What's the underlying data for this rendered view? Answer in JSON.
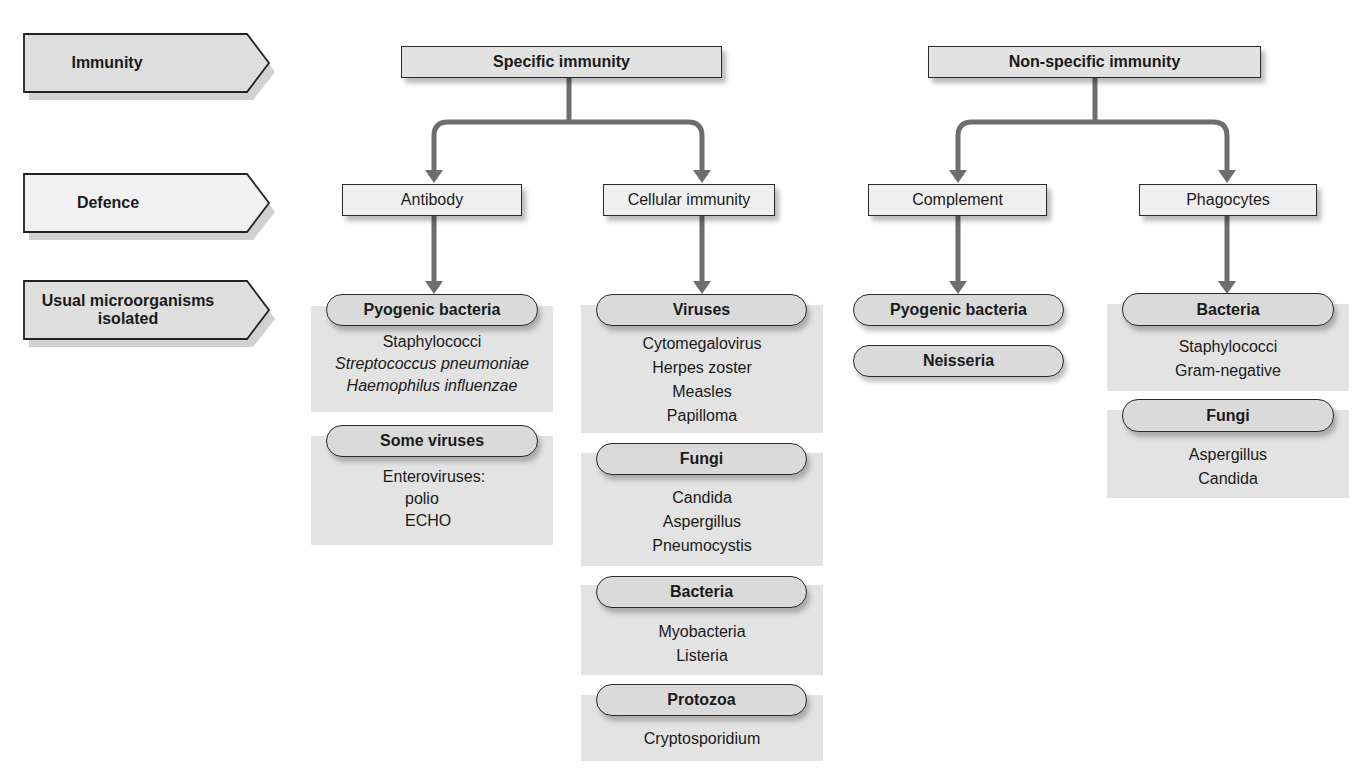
{
  "row_labels": {
    "immunity": "Immunity",
    "defence": "Defence",
    "microorganisms_line1": "Usual microorganisms",
    "microorganisms_line2": "isolated"
  },
  "immunity": {
    "specific": {
      "label": "Specific immunity",
      "defences": [
        {
          "label": "Antibody",
          "groups": [
            {
              "title": "Pyogenic bacteria",
              "items": [
                "Staphylococci",
                "Streptococcus pneumoniae",
                "Haemophilus influenzae"
              ]
            },
            {
              "title": "Some viruses",
              "items": [
                "Enteroviruses:",
                "polio",
                "ECHO"
              ]
            }
          ]
        },
        {
          "label": "Cellular immunity",
          "groups": [
            {
              "title": "Viruses",
              "items": [
                "Cytomegalovirus",
                "Herpes zoster",
                "Measles",
                "Papilloma"
              ]
            },
            {
              "title": "Fungi",
              "items": [
                "Candida",
                "Aspergillus",
                "Pneumocystis"
              ]
            },
            {
              "title": "Bacteria",
              "items": [
                "Myobacteria",
                "Listeria"
              ]
            },
            {
              "title": "Protozoa",
              "items": [
                "Cryptosporidium"
              ]
            }
          ]
        }
      ]
    },
    "non_specific": {
      "label": "Non-specific immunity",
      "defences": [
        {
          "label": "Complement",
          "groups": [
            {
              "title": "Pyogenic bacteria",
              "items": []
            },
            {
              "title": "Neisseria",
              "items": []
            }
          ]
        },
        {
          "label": "Phagocytes",
          "groups": [
            {
              "title": "Bacteria",
              "items": [
                "Staphylococci",
                "Gram-negative"
              ]
            },
            {
              "title": "Fungi",
              "items": [
                "Aspergillus",
                "Candida"
              ]
            }
          ]
        }
      ]
    }
  },
  "colors": {
    "connector": "#6e6e6e",
    "panel": "#e3e3e3",
    "pill": "#dadada",
    "border": "#2a2a2a"
  }
}
